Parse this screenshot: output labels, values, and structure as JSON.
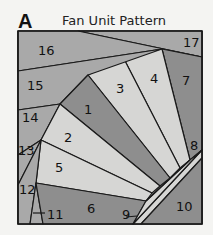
{
  "figure": {
    "letter": "A",
    "title": "Fan Unit Pattern"
  },
  "colors": {
    "dark": "#8e8e8e",
    "medium": "#a9a9a9",
    "light": "#d6d6d4",
    "outline": "#1a1a1a"
  },
  "pieces": [
    {
      "number": "1",
      "shade": "dark"
    },
    {
      "number": "2",
      "shade": "light"
    },
    {
      "number": "3",
      "shade": "light"
    },
    {
      "number": "4",
      "shade": "light"
    },
    {
      "number": "5",
      "shade": "light"
    },
    {
      "number": "6",
      "shade": "dark"
    },
    {
      "number": "7",
      "shade": "dark"
    },
    {
      "number": "8",
      "shade": "light"
    },
    {
      "number": "9",
      "shade": "light"
    },
    {
      "number": "10",
      "shade": "dark"
    },
    {
      "number": "11",
      "shade": "medium"
    },
    {
      "number": "12",
      "shade": "medium"
    },
    {
      "number": "13",
      "shade": "medium"
    },
    {
      "number": "14",
      "shade": "medium"
    },
    {
      "number": "15",
      "shade": "medium"
    },
    {
      "number": "16",
      "shade": "medium"
    },
    {
      "number": "17",
      "shade": "medium"
    }
  ]
}
